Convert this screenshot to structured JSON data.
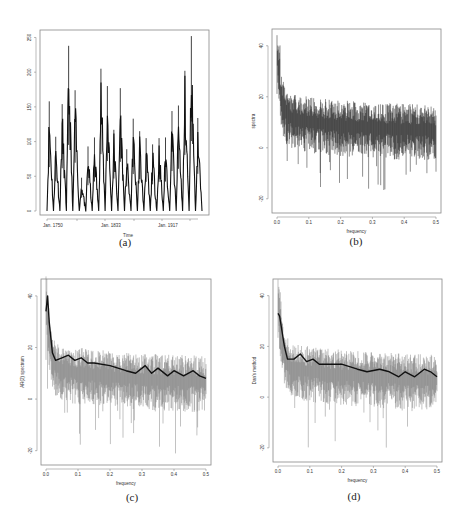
{
  "figure": {
    "panels": [
      {
        "id": "a",
        "caption": "(a)"
      },
      {
        "id": "b",
        "caption": "(b)"
      },
      {
        "id": "c",
        "caption": "(c)"
      },
      {
        "id": "d",
        "caption": "(d)"
      }
    ]
  },
  "chart_data": [
    {
      "panel": "(a)",
      "type": "line",
      "title": "",
      "xlabel": "Time",
      "ylabel": "",
      "x_tick_labels": [
        "Jan. 1750",
        "Jan. 1833",
        "Jan. 1917"
      ],
      "y_ticks": [
        0,
        50,
        100,
        150,
        200,
        250
      ],
      "ylim": [
        0,
        255
      ],
      "grid": false,
      "description": "Monthly sunspot series, ~11-year cycles",
      "cycle_peaks": [
        158,
        107,
        154,
        238,
        174,
        48,
        93,
        106,
        205,
        180,
        117,
        177,
        89,
        133,
        115,
        105,
        96,
        105,
        106,
        144,
        152,
        202,
        252,
        134
      ]
    },
    {
      "panel": "(b)",
      "type": "line",
      "xlabel": "frequency",
      "ylabel": "spectra",
      "x_ticks": [
        0.0,
        0.1,
        0.2,
        0.3,
        0.4,
        0.5
      ],
      "y_ticks": [
        -20,
        0,
        20,
        40
      ],
      "xlim": [
        0,
        0.5
      ],
      "ylim": [
        -24,
        45
      ],
      "grid": false,
      "description": "Raw log periodogram: peak ~45 near 0.005, decaying to ~5-10 by 0.5 with noise down to ~-20"
    },
    {
      "panel": "(c)",
      "type": "line",
      "xlabel": "frequency",
      "ylabel": "AR(2) spectrum",
      "x_ticks": [
        0.0,
        0.1,
        0.2,
        0.3,
        0.4,
        0.5
      ],
      "y_ticks": [
        -20,
        0,
        20,
        40
      ],
      "xlim": [
        0,
        0.5
      ],
      "ylim": [
        -24,
        45
      ],
      "grid": false,
      "series": [
        {
          "name": "periodogram",
          "style": "thin grey"
        },
        {
          "name": "smoothed estimate",
          "style": "thick black",
          "x": [
            0.0,
            0.005,
            0.01,
            0.02,
            0.03,
            0.05,
            0.07,
            0.09,
            0.11,
            0.13,
            0.15,
            0.2,
            0.25,
            0.28,
            0.31,
            0.33,
            0.35,
            0.38,
            0.4,
            0.43,
            0.46,
            0.48,
            0.5
          ],
          "y": [
            34,
            40,
            30,
            18,
            15,
            16,
            17,
            15,
            16,
            14,
            14,
            13,
            11,
            10,
            13,
            10,
            12,
            9,
            11,
            9,
            11,
            9,
            8
          ]
        }
      ]
    },
    {
      "panel": "(d)",
      "type": "line",
      "xlabel": "frequency",
      "ylabel": "Dan's method",
      "x_ticks": [
        0.0,
        0.1,
        0.2,
        0.3,
        0.4,
        0.5
      ],
      "y_ticks": [
        -20,
        0,
        20,
        40
      ],
      "xlim": [
        0,
        0.5
      ],
      "ylim": [
        -24,
        45
      ],
      "grid": false,
      "series": [
        {
          "name": "periodogram",
          "style": "thin grey"
        },
        {
          "name": "smoothed estimate",
          "style": "thick black",
          "x": [
            0.0,
            0.005,
            0.02,
            0.03,
            0.05,
            0.07,
            0.09,
            0.11,
            0.13,
            0.15,
            0.2,
            0.25,
            0.28,
            0.32,
            0.35,
            0.38,
            0.4,
            0.43,
            0.46,
            0.48,
            0.5
          ],
          "y": [
            33,
            32,
            20,
            15,
            15,
            17,
            14,
            15,
            13,
            13,
            13,
            11,
            10,
            11,
            10,
            8,
            10,
            8,
            11,
            10,
            8
          ]
        }
      ]
    }
  ]
}
